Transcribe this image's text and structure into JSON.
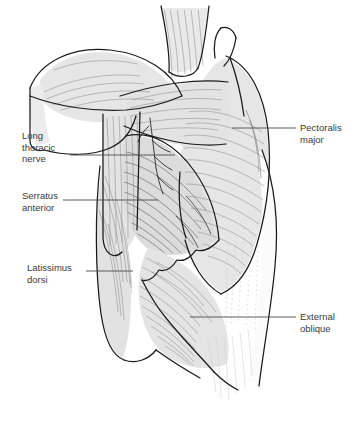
{
  "figure": {
    "background_color": "#ffffff",
    "line_color": "#1a1a1a",
    "fill_light": "#ebebeb",
    "fill_mid": "#d8d8d8",
    "fill_dark": "#bdbdbd",
    "text_color": "#3a3a3a",
    "leader_color": "#4a4a4a"
  },
  "labels": [
    {
      "id": "long-thoracic-nerve",
      "text": "Long\nthoracic\nnerve",
      "side": "left",
      "x": 22,
      "y": 130,
      "leader": {
        "x1": 70,
        "y1": 155,
        "x2": 175,
        "y2": 155
      }
    },
    {
      "id": "serratus-anterior",
      "text": "Serratus\nanterior",
      "side": "left",
      "x": 22,
      "y": 190,
      "leader": {
        "x1": 63,
        "y1": 200,
        "x2": 158,
        "y2": 200
      }
    },
    {
      "id": "latissimus-dorsi",
      "text": "Latissimus\ndorsi",
      "side": "left",
      "x": 27,
      "y": 262,
      "leader": {
        "x1": 86,
        "y1": 271,
        "x2": 133,
        "y2": 271
      }
    },
    {
      "id": "pectoralis-major",
      "text": "Pectoralis\nmajor",
      "side": "right",
      "x": 300,
      "y": 122,
      "leader": {
        "x1": 232,
        "y1": 128,
        "x2": 296,
        "y2": 128
      }
    },
    {
      "id": "external-oblique",
      "text": "External\noblique",
      "side": "right",
      "x": 300,
      "y": 311,
      "leader": {
        "x1": 190,
        "y1": 317,
        "x2": 296,
        "y2": 317
      }
    }
  ],
  "structures": [
    {
      "id": "neck-muscles",
      "name": "neck muscles"
    },
    {
      "id": "deltoid",
      "name": "deltoid"
    },
    {
      "id": "clavicle",
      "name": "clavicle"
    },
    {
      "id": "upper-arm",
      "name": "upper arm"
    },
    {
      "id": "pectoralis-major",
      "name": "pectoralis major"
    },
    {
      "id": "serratus-anterior",
      "name": "serratus anterior"
    },
    {
      "id": "latissimus-dorsi",
      "name": "latissimus dorsi"
    },
    {
      "id": "external-oblique",
      "name": "external oblique"
    },
    {
      "id": "rectus-sheath",
      "name": "rectus sheath"
    }
  ]
}
